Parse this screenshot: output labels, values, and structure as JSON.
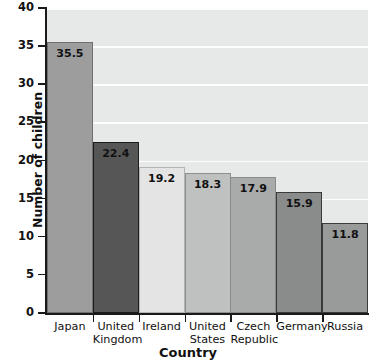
{
  "chart_data": {
    "type": "bar",
    "title": "",
    "xlabel": "Country",
    "ylabel": "Number of children",
    "categories": [
      "Japan",
      "United Kingdom",
      "Ireland",
      "United States",
      "Czech Republic",
      "Germany",
      "Russia"
    ],
    "category_lines": [
      [
        "Japan"
      ],
      [
        "United",
        "Kingdom"
      ],
      [
        "Ireland"
      ],
      [
        "United",
        "States"
      ],
      [
        "Czech",
        "Republic"
      ],
      [
        "Germany"
      ],
      [
        "Russia"
      ]
    ],
    "values": [
      35.5,
      22.4,
      19.2,
      18.3,
      17.9,
      15.9,
      11.8
    ],
    "value_labels": [
      "35.5",
      "22.4",
      "19.2",
      "18.3",
      "17.9",
      "15.9",
      "11.8"
    ],
    "ylim": [
      0,
      40
    ],
    "ytick_labels": [
      "0",
      "5",
      "10",
      "15",
      "20",
      "25",
      "30",
      "35",
      "40"
    ],
    "ytick_values": [
      0,
      5,
      10,
      15,
      20,
      25,
      30,
      35,
      40
    ],
    "grid": "horizontal",
    "legend": "none",
    "bar_colors": [
      "#9d9d9d",
      "#565656",
      "#e4e4e4",
      "#bfc0c0",
      "#a9aaaa",
      "#8a8b8b",
      "#999a9a"
    ],
    "bar_edge_colors": [
      "#707070",
      "#1c1c1c",
      "#b4b4b4",
      "#8d8e8e",
      "#898a8a",
      "#3a3a3a",
      "#3a3a3a"
    ],
    "plot_background": "#e7e8e8",
    "gridline_color": "#fdfdfd",
    "axis_color": "#1a1a1a",
    "page_background": "#ffffff"
  }
}
